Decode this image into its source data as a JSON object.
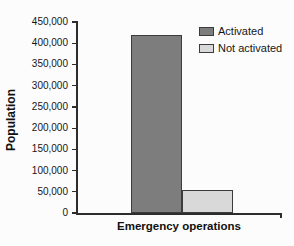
{
  "chart_data": {
    "type": "bar",
    "title": "",
    "xlabel": "Emergency operations",
    "ylabel": "Population",
    "categories": [
      "Emergency operations"
    ],
    "series": [
      {
        "name": "Activated",
        "values": [
          420000
        ],
        "fill": "#7d7d7d"
      },
      {
        "name": "Not activated",
        "values": [
          55000
        ],
        "fill": "#d9d9d9"
      }
    ],
    "ylim": [
      0,
      450000
    ],
    "ytick_step": 50000,
    "ytick_labels": [
      "0",
      "50,000",
      "100,000",
      "150,000",
      "200,000",
      "250,000",
      "300,000",
      "350,000",
      "400,000",
      "450,000"
    ],
    "legend_position": "top-right",
    "grid": false,
    "axis_color": "#2d2d2d",
    "bar_border_color": "#3c3c3c"
  }
}
